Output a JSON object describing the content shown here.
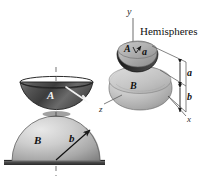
{
  "figure": {
    "caption_label": "Hemispheres",
    "bodies": {
      "upper_label": "A",
      "lower_label": "B"
    },
    "left_view": {
      "body_a_label": "A",
      "body_b_label": "B",
      "radius_label": "b",
      "centerline": "dashed-axis",
      "ground": "ground-line"
    },
    "right_view": {
      "body_a_label": "A",
      "body_b_label": "B",
      "dim_a_label": "a",
      "dim_b_label": "b",
      "axis_x_label": "x",
      "axis_y_label": "y",
      "axis_z_label": "z"
    }
  },
  "colors": {
    "ink": "#1a1a1a",
    "paper": "#ffffff",
    "shade_light": "#cfcfcf",
    "shade_mid": "#9a9a9a",
    "shade_dark": "#4a4a4a",
    "shade_darker": "#2c2c2c",
    "highlight": "#f4f4f4"
  }
}
